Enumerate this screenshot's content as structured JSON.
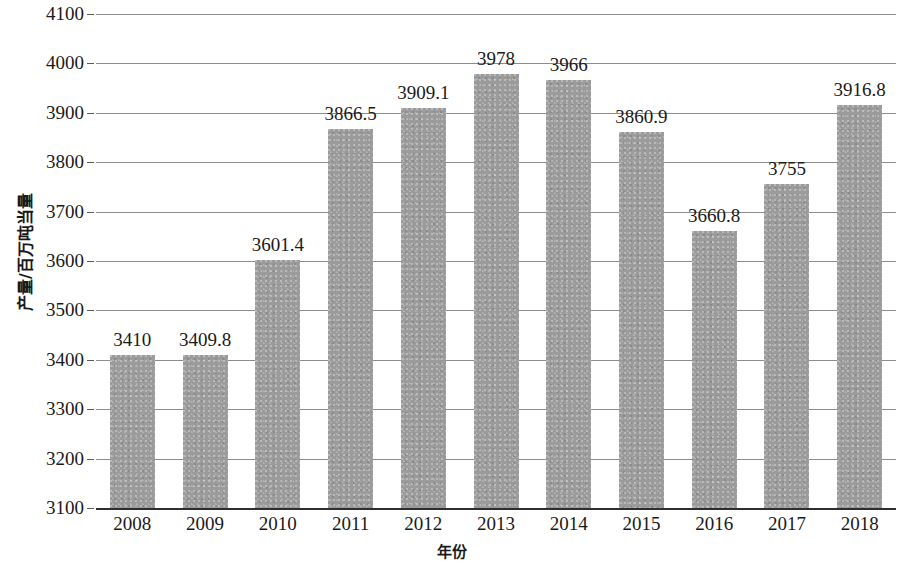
{
  "chart_data": {
    "type": "bar",
    "title": "",
    "subtitle": "",
    "xlabel": "年份",
    "ylabel": "产量/百万吨当量",
    "categories": [
      "2008",
      "2009",
      "2010",
      "2011",
      "2012",
      "2013",
      "2014",
      "2015",
      "2016",
      "2017",
      "2018"
    ],
    "values": [
      3410,
      3409.8,
      3601.4,
      3866.5,
      3909.1,
      3978,
      3966,
      3860.9,
      3660.8,
      3755,
      3916.8
    ],
    "value_labels": [
      "3410",
      "3409.8",
      "3601.4",
      "3866.5",
      "3909.1",
      "3978",
      "3966",
      "3860.9",
      "3660.8",
      "3755",
      "3916.8"
    ],
    "ylim": [
      3100,
      4100
    ],
    "ytick_step": 100,
    "ytick_labels": [
      "4100",
      "4000",
      "3900",
      "3800",
      "3700",
      "3600",
      "3500",
      "3400",
      "3300",
      "3200",
      "3100"
    ],
    "ytick_values": [
      4100,
      4000,
      3900,
      3800,
      3700,
      3600,
      3500,
      3400,
      3300,
      3200,
      3100
    ],
    "grid": true,
    "legend": false,
    "legend_position": "none",
    "series": [
      {
        "name": "产量",
        "color": "#9b9b9b",
        "values": [
          3410,
          3409.8,
          3601.4,
          3866.5,
          3909.1,
          3978,
          3966,
          3860.9,
          3660.8,
          3755,
          3916.8
        ]
      }
    ],
    "colors": {
      "bar_fill": "#9b9b9b",
      "gridline": "#8d8d8d",
      "axis_line": "#2e2e2e",
      "text": "#1a1a1a",
      "background": "#ffffff"
    }
  }
}
